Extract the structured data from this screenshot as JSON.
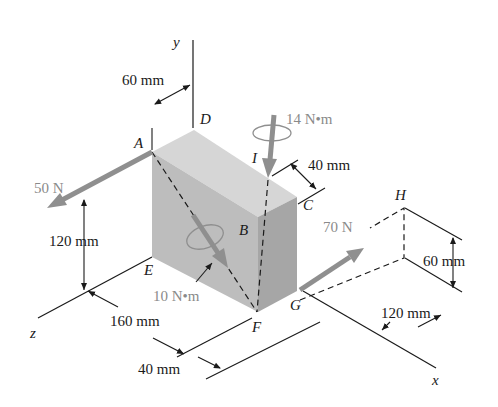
{
  "figure": {
    "axes": {
      "x": "x",
      "y": "y",
      "z": "z"
    },
    "points": {
      "A": "A",
      "B": "B",
      "C": "C",
      "D": "D",
      "E": "E",
      "F": "F",
      "G": "G",
      "H": "H",
      "I": "I"
    },
    "loads": {
      "force_A": "50 N",
      "force_G": "70 N",
      "couple_I": "14 N•m",
      "couple_diag": "10 N•m"
    },
    "dimensions": {
      "d_60_top": "60 mm",
      "d_40_top": "40 mm",
      "d_120_left": "120 mm",
      "d_160": "160 mm",
      "d_40_bottom": "40 mm",
      "d_60_right": "60 mm",
      "d_120_right": "120 mm"
    },
    "colors": {
      "load_arrow": "#8f8f8f",
      "box_front": "#bdbdbd",
      "box_top": "#d6d6d6",
      "box_side": "#a9a9a9",
      "line": "#1a1a1a"
    }
  }
}
